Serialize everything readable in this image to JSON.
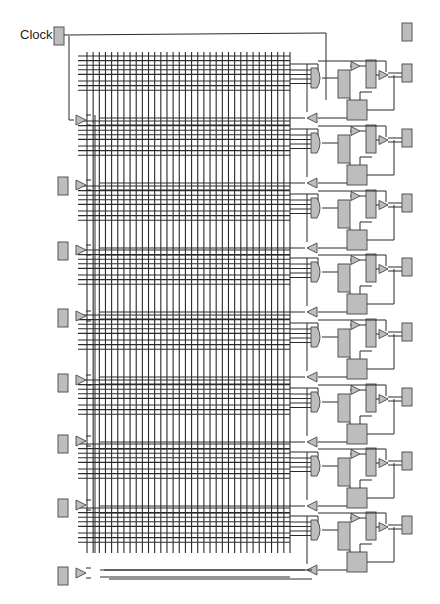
{
  "diagram": {
    "clock_label": "Clock",
    "colors": {
      "wire": "#2a2a2a",
      "fill": "#bdbdbd",
      "stroke": "#555555",
      "background": "#ffffff"
    },
    "clock_pad": {
      "x": 54,
      "y": 27,
      "w": 10,
      "h": 18
    },
    "top_right_pad": {
      "x": 402,
      "y": 23,
      "w": 10,
      "h": 18
    },
    "grid": {
      "x_start": 87,
      "x_end": 290,
      "vertical_count": 34,
      "y_top": 52,
      "y_bottom": 553
    },
    "left_pads_y": [
      186,
      251,
      318,
      383,
      444,
      508,
      576
    ],
    "left_buffers_y": [
      120,
      185,
      250,
      316,
      380,
      441,
      505,
      573
    ],
    "blocks_y": [
      78,
      143,
      208,
      272,
      337,
      402,
      466,
      530
    ],
    "bottom_bus": {
      "y1": 570,
      "y2": 579,
      "x_start": 104,
      "x_end": 312
    }
  }
}
